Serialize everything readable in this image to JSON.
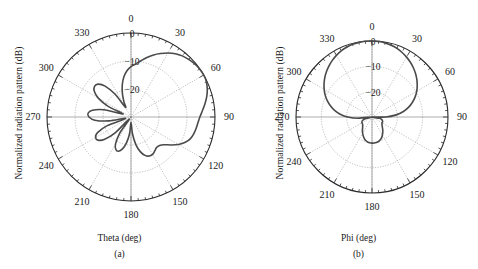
{
  "figure": {
    "background": "#ffffff",
    "curve_color": "#4a4a4a",
    "grid_color": "#8d8d8d",
    "axis_color": "#2a2a2a"
  },
  "panels": [
    {
      "id": "a",
      "caption": "(a)",
      "xlabel": "Theta (deg)",
      "ylabel": "Normalized radiation pattern (dB)",
      "angular_labels": [
        "0",
        "30",
        "60",
        "90",
        "120",
        "150",
        "180",
        "210",
        "240",
        "270",
        "300",
        "330"
      ],
      "radial_labels": [
        "0",
        "−10",
        "−20"
      ],
      "center": {
        "x": 131,
        "y": 117
      },
      "radius": 84
    },
    {
      "id": "b",
      "caption": "(b)",
      "xlabel": "Phi (deg)",
      "ylabel": "Normalized radiation pattern (dB)",
      "angular_labels": [
        "0",
        "30",
        "60",
        "90",
        "120",
        "150",
        "180",
        "210",
        "240",
        "270",
        "300",
        "330"
      ],
      "radial_labels": [
        "0",
        "−10",
        "−20"
      ],
      "center": {
        "x": 133,
        "y": 117
      },
      "radius": 76
    }
  ],
  "chart_data": [
    {
      "type": "line",
      "subtype": "polar",
      "title": "(a)",
      "xlabel": "Theta (deg)",
      "ylabel": "Normalized radiation pattern (dB)",
      "angle_unit": "deg",
      "angle_zero_at": "top",
      "angle_direction": "clockwise",
      "rlim": [
        -30,
        0
      ],
      "rticks": [
        0,
        -10,
        -20
      ],
      "thetaticks": [
        0,
        30,
        60,
        90,
        120,
        150,
        180,
        210,
        240,
        270,
        300,
        330
      ],
      "grid": true,
      "legend": null,
      "series": [
        {
          "name": "Theta cut",
          "theta": [
            0,
            5,
            10,
            15,
            20,
            25,
            30,
            35,
            40,
            45,
            50,
            55,
            60,
            65,
            70,
            75,
            80,
            85,
            90,
            95,
            100,
            105,
            110,
            115,
            120,
            125,
            130,
            135,
            140,
            145,
            150,
            155,
            160,
            165,
            170,
            175,
            180,
            185,
            190,
            195,
            200,
            205,
            210,
            215,
            220,
            225,
            230,
            235,
            240,
            245,
            250,
            255,
            260,
            265,
            270,
            275,
            280,
            285,
            290,
            295,
            300,
            305,
            310,
            315,
            320,
            325,
            330,
            335,
            340,
            345,
            350,
            355
          ],
          "values_db": [
            -12.0,
            -11.0,
            -9.6,
            -8.0,
            -6.4,
            -5.0,
            -3.6,
            -2.4,
            -1.5,
            -0.9,
            -0.4,
            -0.1,
            0.0,
            -0.3,
            -1.0,
            -2.0,
            -3.2,
            -4.4,
            -5.4,
            -6.0,
            -6.4,
            -6.8,
            -7.4,
            -8.6,
            -10.4,
            -12.6,
            -14.6,
            -15.6,
            -15.8,
            -15.2,
            -14.6,
            -14.6,
            -15.4,
            -17.2,
            -20.0,
            -24.0,
            -28.0,
            -24.0,
            -20.5,
            -18.2,
            -17.0,
            -17.2,
            -19.0,
            -23.0,
            -29.0,
            -22.0,
            -17.5,
            -15.6,
            -15.4,
            -16.8,
            -21.0,
            -28.0,
            -22.0,
            -17.0,
            -15.0,
            -14.6,
            -16.0,
            -20.0,
            -27.0,
            -21.0,
            -16.5,
            -14.0,
            -13.0,
            -13.4,
            -15.6,
            -20.0,
            -26.0,
            -24.0,
            -21.0,
            -18.0,
            -15.4,
            -13.4
          ]
        }
      ]
    },
    {
      "type": "line",
      "subtype": "polar",
      "title": "(b)",
      "xlabel": "Phi (deg)",
      "ylabel": "Normalized radiation pattern (dB)",
      "angle_unit": "deg",
      "angle_zero_at": "top",
      "angle_direction": "clockwise",
      "rlim": [
        -30,
        0
      ],
      "rticks": [
        0,
        -10,
        -20
      ],
      "thetaticks": [
        0,
        30,
        60,
        90,
        120,
        150,
        180,
        210,
        240,
        270,
        300,
        330
      ],
      "grid": true,
      "legend": null,
      "series": [
        {
          "name": "Phi cut",
          "theta": [
            0,
            5,
            10,
            15,
            20,
            25,
            30,
            35,
            40,
            45,
            50,
            55,
            60,
            65,
            70,
            75,
            80,
            85,
            90,
            95,
            100,
            105,
            110,
            115,
            120,
            125,
            130,
            135,
            140,
            145,
            150,
            155,
            160,
            165,
            170,
            175,
            180,
            185,
            190,
            195,
            200,
            205,
            210,
            215,
            220,
            225,
            230,
            235,
            240,
            245,
            250,
            255,
            260,
            265,
            270,
            275,
            280,
            285,
            290,
            295,
            300,
            305,
            310,
            315,
            320,
            325,
            330,
            335,
            340,
            345,
            350,
            355
          ],
          "values_db": [
            0.0,
            -0.1,
            -0.3,
            -0.7,
            -1.2,
            -1.9,
            -2.7,
            -3.6,
            -4.6,
            -5.7,
            -6.9,
            -8.2,
            -9.6,
            -11.2,
            -13.0,
            -15.0,
            -17.4,
            -20.4,
            -24.5,
            -30.0,
            -27.0,
            -26.0,
            -25.6,
            -25.4,
            -25.4,
            -25.2,
            -24.8,
            -24.2,
            -23.4,
            -22.6,
            -21.8,
            -21.0,
            -20.4,
            -20.0,
            -19.8,
            -19.7,
            -19.7,
            -19.8,
            -20.0,
            -20.4,
            -21.0,
            -21.8,
            -22.6,
            -23.4,
            -24.2,
            -24.8,
            -25.2,
            -25.4,
            -25.4,
            -25.6,
            -26.0,
            -27.0,
            -30.0,
            -24.5,
            -20.4,
            -17.4,
            -15.0,
            -13.0,
            -11.2,
            -9.6,
            -8.2,
            -6.9,
            -5.7,
            -4.6,
            -3.6,
            -2.7,
            -1.9,
            -1.2,
            -0.7,
            -0.3,
            -0.1,
            0.0
          ]
        }
      ]
    }
  ]
}
